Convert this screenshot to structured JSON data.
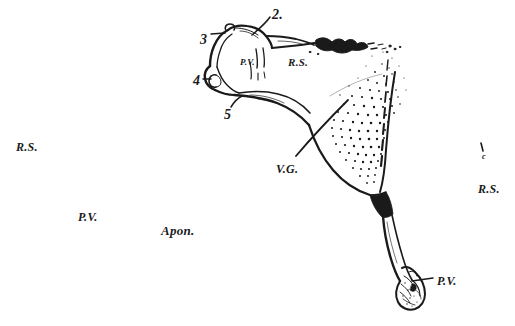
{
  "figure": {
    "kind": "anatomical-line-drawing",
    "background_color": "#ffffff",
    "ink_color": "#1a1a1a",
    "width": 515,
    "height": 326
  },
  "labels": {
    "callout_2": {
      "text": "2.",
      "x": 272,
      "y": 8
    },
    "callout_3": {
      "text": "3",
      "x": 200,
      "y": 33
    },
    "callout_4": {
      "text": "4",
      "x": 193,
      "y": 74
    },
    "callout_5": {
      "text": "5",
      "x": 224,
      "y": 108
    },
    "pv_bone": {
      "text": "P.V.",
      "x": 240,
      "y": 58
    },
    "rs_bone": {
      "text": "R.S.",
      "x": 288,
      "y": 57
    },
    "rs_left": {
      "text": "R.S.",
      "x": 16,
      "y": 141
    },
    "pv_left": {
      "text": "P.V.",
      "x": 78,
      "y": 211
    },
    "apon_center": {
      "text": "Apon.",
      "x": 161,
      "y": 224
    },
    "vg_center": {
      "text": "V.G.",
      "x": 276,
      "y": 163
    },
    "rs_right": {
      "text": "R.S.",
      "x": 478,
      "y": 183
    },
    "c_right": {
      "text": "c",
      "x": 482,
      "y": 153
    },
    "pv_bottom": {
      "text": "P.V.",
      "x": 437,
      "y": 275
    }
  },
  "annotations": {
    "leader_lines": [
      {
        "name": "leader-2",
        "from_label": "2.",
        "to_structure": "torn-superior-margin"
      },
      {
        "name": "leader-3",
        "from_label": "3",
        "to_structure": "upper-bone-process"
      },
      {
        "name": "leader-4",
        "from_label": "4",
        "to_structure": "glenoid-notch"
      },
      {
        "name": "leader-5",
        "from_label": "5",
        "to_structure": "inferior-bone-margin"
      },
      {
        "name": "leader-vg",
        "from_label": "V.G.",
        "to_structure": "muscle-belly-crossing"
      },
      {
        "name": "leader-pv-bottom",
        "from_label": "P.V.",
        "to_structure": "distal-tendon-insertion"
      },
      {
        "name": "leader-c",
        "from_label": "c",
        "to_structure": "lateral-border"
      }
    ]
  }
}
